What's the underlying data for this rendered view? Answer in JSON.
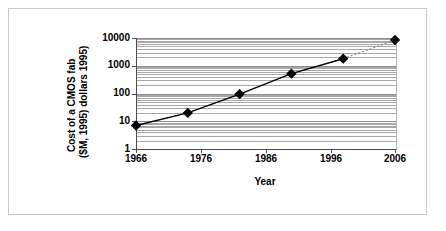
{
  "figure": {
    "background_color": "#ffffff",
    "frame_color": "#c9c9c9"
  },
  "chart_data": {
    "type": "line",
    "title": "",
    "xlabel": "Year",
    "ylabel": "Cost of a CMOS fab ($M, 1995) dollars 1995)",
    "ylabel_line1": "Cost of a CMOS fab",
    "ylabel_line2": "($M, 1995) dollars 1995)",
    "yscale": "log",
    "ylim": [
      1,
      10000
    ],
    "xlim": [
      1966,
      2006
    ],
    "ytick_labels": [
      "1",
      "10",
      "100",
      "1000",
      "10000"
    ],
    "ytick_values": [
      1,
      10,
      100,
      1000,
      10000
    ],
    "xtick_labels": [
      "1966",
      "1976",
      "1986",
      "1996",
      "2006"
    ],
    "xtick_values": [
      1966,
      1976,
      1986,
      1996,
      2006
    ],
    "grid": "horizontal-log-minor",
    "legend": "none",
    "marker": "diamond",
    "marker_color": "#000000",
    "line_color": "#000000",
    "series": [
      {
        "name": "Cost of a CMOS fab",
        "x": [
          1966,
          1974,
          1982,
          1990,
          1998,
          2006
        ],
        "y": [
          7,
          20,
          95,
          520,
          1800,
          8500
        ],
        "points": [
          {
            "year": 1966,
            "cost": 7
          },
          {
            "year": 1974,
            "cost": 20
          },
          {
            "year": 1982,
            "cost": 95
          },
          {
            "year": 1990,
            "cost": 520
          },
          {
            "year": 1998,
            "cost": 1800
          },
          {
            "year": 2006,
            "cost": 8500
          }
        ]
      }
    ]
  }
}
